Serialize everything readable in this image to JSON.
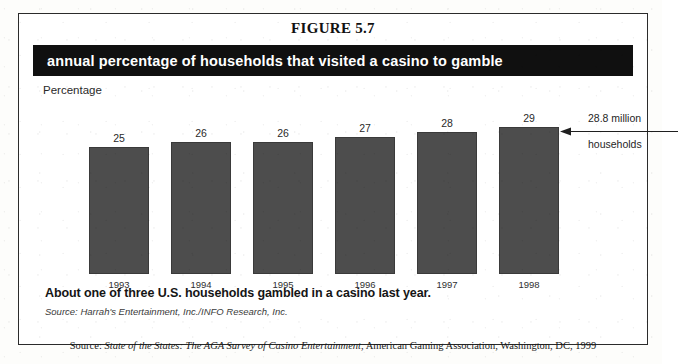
{
  "figure": {
    "title": "FIGURE 5.7",
    "banner_text": "annual percentage of households that visited a casino to gamble",
    "caption": "About one of three U.S. households gambled in a casino last year.",
    "source_inner": "Source: Harrah's Entertainment, Inc./INFO Research, Inc.",
    "source_bottom_prefix": "Source: ",
    "source_bottom_italic": "State of the States: The AGA Survey of Casino Entertainment",
    "source_bottom_suffix": ", American Gaming Association, Washington, DC, 1999"
  },
  "annotation": {
    "line1": "28.8 million",
    "line2": "households",
    "arrow_direction": "left"
  },
  "colors": {
    "bar": "#4d4d4d",
    "banner_bg": "#101010",
    "banner_text": "#ffffff",
    "frame_border": "#2b2b2b"
  },
  "chart_data": {
    "type": "bar",
    "title": "annual percentage of households that visited a casino to gamble",
    "xlabel": "",
    "ylabel": "Percentage",
    "categories": [
      "1993",
      "1994",
      "1995",
      "1996",
      "1997",
      "1998"
    ],
    "values": [
      25,
      26,
      26,
      27,
      28,
      29
    ],
    "value_labels": [
      "25",
      "26",
      "26",
      "27",
      "28",
      "29"
    ],
    "ylim": [
      0,
      32
    ],
    "grid": false,
    "legend": "none",
    "annotations": [
      {
        "target_category": "1998",
        "text": "28.8 million households"
      }
    ]
  }
}
